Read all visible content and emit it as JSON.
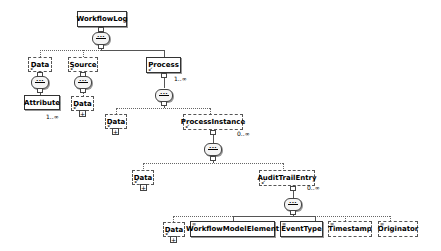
{
  "diagram": {
    "type": "xml-schema-tree",
    "root": {
      "label": "WorkflowLog",
      "style": "solid"
    },
    "nodes": {
      "wl_data": {
        "label": "Data",
        "style": "optional",
        "children": [
          "wl_data_attribute"
        ]
      },
      "wl_data_attribute": {
        "label": "Attribute",
        "style": "solid-multiple",
        "cardinality": "1..∞"
      },
      "source": {
        "label": "Source",
        "style": "optional",
        "children": [
          "source_data"
        ]
      },
      "source_data": {
        "label": "Data",
        "style": "optional",
        "collapsed": true
      },
      "process": {
        "label": "Process",
        "style": "solid-multiple",
        "cardinality": "1..∞"
      },
      "process_data": {
        "label": "Data",
        "style": "optional",
        "collapsed": true
      },
      "process_instance": {
        "label": "ProcessInstance",
        "style": "optional-multiple",
        "cardinality": "0..∞"
      },
      "pi_data": {
        "label": "Data",
        "style": "optional",
        "collapsed": true
      },
      "audit_trail_entry": {
        "label": "AuditTrailEntry",
        "style": "optional-multiple",
        "cardinality": "0..∞"
      },
      "ate_data": {
        "label": "Data",
        "style": "optional",
        "collapsed": true
      },
      "workflow_model_element": {
        "label": "WorkflowModelElement",
        "style": "solid"
      },
      "event_type": {
        "label": "EventType",
        "style": "solid"
      },
      "timestamp": {
        "label": "Timestamp",
        "style": "optional"
      },
      "originator": {
        "label": "Originator",
        "style": "optional"
      }
    },
    "compositor_icon": "sequence-icon",
    "expand_icon": "+"
  }
}
